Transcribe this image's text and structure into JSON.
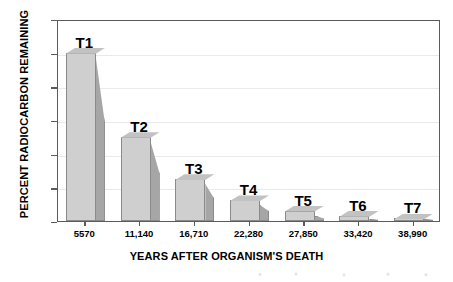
{
  "chart_data": {
    "type": "bar",
    "title": "",
    "subtitle": "",
    "xlabel": "YEARS AFTER ORGANISM'S DEATH",
    "ylabel": "PERCENT RADIOCARBON REMAINING",
    "categories": [
      "5570",
      "11,140",
      "16,710",
      "22,280",
      "27,850",
      "33,420",
      "38,990"
    ],
    "values": [
      50,
      25,
      12.5,
      6.25,
      3.1,
      1.6,
      0.8
    ],
    "point_labels": [
      "T1",
      "T2",
      "T3",
      "T4",
      "T5",
      "T6",
      "T7"
    ],
    "ylim": [
      0,
      60
    ],
    "ytick_values": [
      0,
      10,
      20,
      30,
      40,
      50,
      60
    ],
    "ytick_labels": [
      "0",
      "10",
      "20",
      "30",
      "40",
      "50",
      "60"
    ],
    "grid": true,
    "legend": "none",
    "bar_style": "3d-extruded",
    "colors": {
      "bar_front": "#cfcfcf",
      "bar_side": "#a6a6a6",
      "bar_top": "#c2c2c2",
      "bar_edge": "#8a8a8a",
      "axis": "#5b5b5b",
      "grid": "#e9e9e9",
      "text": "#000000",
      "background": "#ffffff"
    }
  }
}
